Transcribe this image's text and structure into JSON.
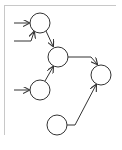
{
  "diagram": {
    "type": "directed-graph",
    "frame_color": "#c8c8c8",
    "stroke_color": "#333333",
    "nodes": [
      {
        "id": "n1",
        "cx": 40,
        "cy": 23,
        "r": 10
      },
      {
        "id": "n2",
        "cx": 58,
        "cy": 57,
        "r": 10
      },
      {
        "id": "n3",
        "cx": 40,
        "cy": 90,
        "r": 10
      },
      {
        "id": "n4",
        "cx": 101,
        "cy": 75,
        "r": 10
      },
      {
        "id": "n5",
        "cx": 57,
        "cy": 125,
        "r": 10
      }
    ],
    "edges": [
      {
        "from": "input-1",
        "to": "n1"
      },
      {
        "from": "input-2",
        "to": "n1"
      },
      {
        "from": "input-3",
        "to": "n3"
      },
      {
        "from": "n1",
        "to": "n2"
      },
      {
        "from": "n3",
        "to": "n2"
      },
      {
        "from": "n2",
        "to": "n4"
      },
      {
        "from": "n5",
        "to": "n4"
      }
    ]
  }
}
